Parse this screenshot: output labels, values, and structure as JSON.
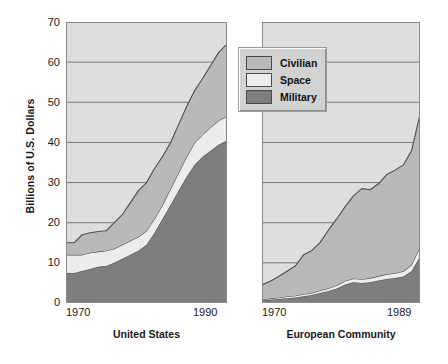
{
  "chart_data": {
    "type": "area",
    "title": "",
    "ylabel": "Billions of U.S. Dollars",
    "xlabel": "",
    "stacked": true,
    "grid": true,
    "ylim": [
      0,
      70
    ],
    "yticks": [
      0,
      10,
      20,
      30,
      40,
      50,
      60,
      70
    ],
    "legend": {
      "position": "top-center",
      "entries": [
        {
          "label": "Civilian",
          "color": "#b9b9b9"
        },
        {
          "label": "Space",
          "color": "#ececed"
        },
        {
          "label": "Military",
          "color": "#7e7e7e"
        }
      ]
    },
    "panels": [
      {
        "name": "United States",
        "xlabel": "United States",
        "xlim": [
          1970,
          1990
        ],
        "xticks": [
          1970,
          1990
        ],
        "xticklabels": [
          "1970",
          "1990"
        ],
        "x": [
          1970,
          1971,
          1972,
          1973,
          1974,
          1975,
          1976,
          1977,
          1978,
          1979,
          1980,
          1981,
          1982,
          1983,
          1984,
          1985,
          1986,
          1987,
          1988,
          1989,
          1990
        ],
        "series": [
          {
            "name": "Military",
            "values": [
              7.5,
              7.5,
              8.0,
              8.5,
              9.0,
              9.2,
              10.0,
              11.0,
              12.0,
              13.0,
              14.5,
              17.5,
              21.0,
              24.5,
              28.0,
              31.5,
              34.5,
              36.5,
              38.0,
              39.5,
              40.5
            ]
          },
          {
            "name": "Space",
            "values": [
              4.5,
              4.5,
              4.0,
              4.0,
              3.8,
              3.8,
              3.5,
              3.5,
              3.5,
              3.5,
              3.5,
              3.5,
              3.5,
              4.0,
              4.5,
              5.0,
              5.5,
              5.5,
              5.8,
              6.0,
              6.0
            ]
          },
          {
            "name": "Civilian",
            "values": [
              3.0,
              3.0,
              5.0,
              5.0,
              5.0,
              5.0,
              6.5,
              7.5,
              9.5,
              11.5,
              12.0,
              12.5,
              12.0,
              11.5,
              12.0,
              12.5,
              13.0,
              14.0,
              15.5,
              17.0,
              18.0
            ]
          }
        ],
        "totals": [
          15.0,
          15.0,
          17.0,
          17.5,
          17.8,
          18.0,
          20.0,
          22.0,
          25.0,
          28.0,
          30.0,
          33.5,
          36.5,
          40.0,
          44.5,
          49.0,
          53.0,
          56.0,
          59.3,
          62.5,
          64.5
        ]
      },
      {
        "name": "European Community",
        "xlabel": "European Community",
        "xlim": [
          1970,
          1989
        ],
        "xticks": [
          1970,
          1989
        ],
        "xticklabels": [
          "1970",
          "1989"
        ],
        "x": [
          1970,
          1971,
          1972,
          1973,
          1974,
          1975,
          1976,
          1977,
          1978,
          1979,
          1980,
          1981,
          1982,
          1983,
          1984,
          1985,
          1986,
          1987,
          1988,
          1989
        ],
        "series": [
          {
            "name": "Military",
            "values": [
              0.6,
              0.8,
              1.0,
              1.2,
              1.4,
              1.7,
              2.0,
              2.5,
              3.0,
              3.6,
              4.6,
              5.2,
              5.0,
              5.2,
              5.6,
              6.0,
              6.2,
              6.6,
              8.0,
              11.5
            ]
          },
          {
            "name": "Space",
            "values": [
              0.3,
              0.3,
              0.3,
              0.4,
              0.4,
              0.5,
              0.5,
              0.6,
              0.7,
              0.8,
              0.9,
              0.9,
              0.9,
              1.0,
              1.1,
              1.2,
              1.2,
              1.3,
              1.6,
              2.5
            ]
          },
          {
            "name": "Civilian",
            "values": [
              3.6,
              4.3,
              5.3,
              6.3,
              7.4,
              9.8,
              10.6,
              12.0,
              14.5,
              16.6,
              18.5,
              20.6,
              22.6,
              22.0,
              23.0,
              24.8,
              25.7,
              26.5,
              28.4,
              33.0
            ]
          }
        ],
        "totals": [
          4.5,
          5.4,
          6.6,
          7.9,
          9.2,
          12.0,
          13.1,
          15.1,
          18.2,
          21.0,
          24.0,
          26.7,
          28.5,
          28.2,
          29.7,
          32.0,
          33.1,
          34.4,
          38.0,
          47.0
        ]
      }
    ]
  },
  "colors": {
    "civilian": "#b9b9b9",
    "space": "#ececed",
    "military": "#7e7e7e",
    "plot_background": "#dedede",
    "gridline": "#6e6e6e",
    "plot_border": "#8a8a8a",
    "series_outline": "#4d4d4d",
    "text": "#1a1a1a",
    "legend_background": "#d2d2d2",
    "legend_border": "#9a9a9a"
  },
  "axes": {
    "y_title": "Billions of U.S. Dollars",
    "y_tick_labels": [
      "70",
      "60",
      "50",
      "40",
      "30",
      "20",
      "10",
      "0"
    ]
  }
}
